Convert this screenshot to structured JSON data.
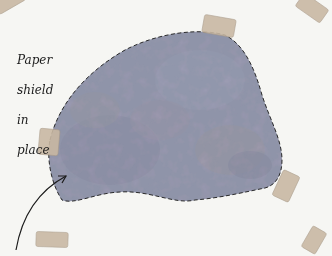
{
  "image": {
    "description": "Painted patch on paper with dashed outline, held by tape pieces, with handwritten annotation and arrow",
    "annotation": {
      "lines": [
        "Paper",
        "shield",
        "in",
        "place"
      ]
    },
    "colors": {
      "background": "#f6f6f3",
      "patch_base": "#8f93a8",
      "patch_dark": "#5b5670",
      "patch_ochre": "#b39a72",
      "patch_pink": "#b48f96",
      "tape": "#c9b8a3",
      "outline": "#2a2a2a",
      "arrow": "#1c1c1c"
    },
    "tape_pieces": [
      {
        "name": "top-left-tape",
        "x": -6,
        "y": -8,
        "w": 30,
        "h": 16,
        "rot": -30
      },
      {
        "name": "top-tape",
        "x": 203,
        "y": 17,
        "w": 32,
        "h": 18,
        "rot": 10
      },
      {
        "name": "top-right-tape",
        "x": 297,
        "y": 0,
        "w": 30,
        "h": 16,
        "rot": 35
      },
      {
        "name": "left-tape",
        "x": 39,
        "y": 129,
        "w": 20,
        "h": 26,
        "rot": 5
      },
      {
        "name": "right-tape",
        "x": 277,
        "y": 172,
        "w": 18,
        "h": 28,
        "rot": 25
      },
      {
        "name": "bottom-left-tape",
        "x": 36,
        "y": 232,
        "w": 32,
        "h": 15,
        "rot": 2
      },
      {
        "name": "bottom-right-tape",
        "x": 306,
        "y": 228,
        "w": 16,
        "h": 24,
        "rot": 30
      }
    ]
  }
}
